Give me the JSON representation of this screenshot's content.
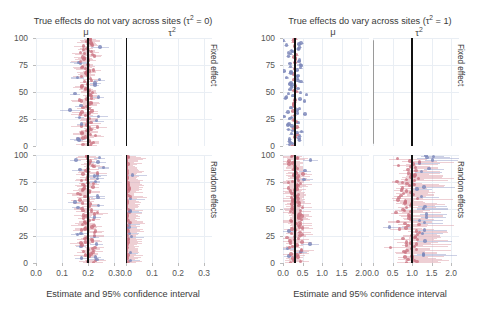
{
  "figure": {
    "width": 493,
    "height": 310,
    "xlabel": "Estimate and 95% confidence interval",
    "colors": {
      "covering_point": "#cb7482",
      "covering_interval": "#d68c98",
      "noncovering_point": "#7d88ba",
      "noncovering_interval": "#8690c0",
      "truth_line": "#111111",
      "estimate_line_gray": "#9a9a9a",
      "gridline": "#e9eef4"
    }
  },
  "panels": [
    {
      "id": "tau2-zero",
      "title": "True effects do not vary across sites (τ² = 0)",
      "columns": [
        "μ",
        "τ²"
      ],
      "rows": [
        "Fixed effect",
        "Random effects"
      ],
      "x_ticks": [
        "0.0",
        "0.1",
        "0.2",
        "0.3"
      ],
      "x_values": [
        0.0,
        0.1,
        0.2,
        0.3
      ],
      "y_ticks": [
        "0",
        "25",
        "50",
        "75",
        "100"
      ],
      "y_values": [
        0,
        25,
        50,
        75,
        100
      ]
    },
    {
      "id": "tau2-one",
      "title": "True effects do vary across sites (τ² = 1)",
      "columns": [
        "μ",
        "τ²"
      ],
      "rows": [
        "Fixed effect",
        "Random effects"
      ],
      "x_ticks": [
        "0.0",
        "0.5",
        "1.0",
        "1.5",
        "2.0"
      ],
      "x_values": [
        0.0,
        0.5,
        1.0,
        1.5,
        2.0
      ],
      "y_ticks": [
        "0",
        "25",
        "50",
        "75",
        "100"
      ],
      "y_values": [
        0,
        25,
        50,
        75,
        100
      ]
    }
  ],
  "chart_data": {
    "type": "scatter",
    "xlabel": "Estimate and 95% confidence interval",
    "ylabel": "",
    "legend": [
      "interval covers truth (pink)",
      "interval misses truth (blue-purple)"
    ],
    "grid": true,
    "n_simulations": 100,
    "subplots": [
      {
        "panel": "tau2-zero",
        "row": "Fixed effect",
        "column": "μ",
        "xlim": [
          0.0,
          0.33
        ],
        "ylim": [
          0,
          100
        ],
        "truth": 0.2,
        "estimate_center": 0.2,
        "estimate_spread": 0.022,
        "ci_halfwidth_mean": 0.028,
        "coverage": 0.94,
        "note": "tight pink cloud straddling truth line at 0.2"
      },
      {
        "panel": "tau2-zero",
        "row": "Fixed effect",
        "column": "τ²",
        "xlim": [
          0.0,
          0.33
        ],
        "ylim": [
          0,
          100
        ],
        "truth": 0.0,
        "estimate_center": 0.0,
        "estimate_spread": 0.0,
        "ci_halfwidth_mean": 0.0,
        "coverage": 1.0,
        "note": "fixed-effect model forces tau-squared to exactly 0; only the black truth line is visible"
      },
      {
        "panel": "tau2-zero",
        "row": "Random effects",
        "column": "μ",
        "xlim": [
          0.0,
          0.33
        ],
        "ylim": [
          0,
          100
        ],
        "truth": 0.2,
        "estimate_center": 0.2,
        "estimate_spread": 0.023,
        "ci_halfwidth_mean": 0.03,
        "coverage": 0.95,
        "note": "similar tight pink cloud around 0.2"
      },
      {
        "panel": "tau2-zero",
        "row": "Random effects",
        "column": "τ²",
        "xlim": [
          0.0,
          0.33
        ],
        "ylim": [
          0,
          100
        ],
        "truth": 0.0,
        "estimate_center": 0.004,
        "estimate_spread": 0.006,
        "ci_halfwidth_mean": 0.03,
        "coverage": 1.0,
        "note": "estimates pile up at the 0 boundary with right-skewed intervals"
      },
      {
        "panel": "tau2-one",
        "row": "Fixed effect",
        "column": "μ",
        "xlim": [
          0.0,
          2.2
        ],
        "ylim": [
          0,
          100
        ],
        "truth": 0.3,
        "estimate_center": 0.3,
        "estimate_spread": 0.13,
        "ci_halfwidth_mean": 0.055,
        "coverage": 0.38,
        "note": "mostly blue-purple: fixed-effect intervals are too narrow when heterogeneity exists"
      },
      {
        "panel": "tau2-one",
        "row": "Fixed effect",
        "column": "τ²",
        "xlim": [
          0.0,
          2.2
        ],
        "ylim": [
          0,
          100
        ],
        "truth": 1.0,
        "estimate_center": 0.0,
        "estimate_spread": 0.0,
        "ci_halfwidth_mean": 0.0,
        "coverage": 0.0,
        "note": "gray line of zero estimates sits far from the black truth line at 1.0"
      },
      {
        "panel": "tau2-one",
        "row": "Random effects",
        "column": "μ",
        "xlim": [
          0.0,
          2.2
        ],
        "ylim": [
          0,
          100
        ],
        "truth": 0.3,
        "estimate_center": 0.3,
        "estimate_spread": 0.13,
        "ci_halfwidth_mean": 0.22,
        "coverage": 0.94,
        "note": "pink dominant: wider random-effects intervals restore coverage"
      },
      {
        "panel": "tau2-one",
        "row": "Random effects",
        "column": "τ²",
        "xlim": [
          0.0,
          2.2
        ],
        "ylim": [
          0,
          100
        ],
        "truth": 1.0,
        "estimate_center": 1.0,
        "estimate_spread": 0.22,
        "ci_halfwidth_mean": 0.42,
        "coverage": 0.93,
        "note": "pink cloud centred on the truth line at 1.0 with wide right-skewed intervals"
      }
    ]
  }
}
